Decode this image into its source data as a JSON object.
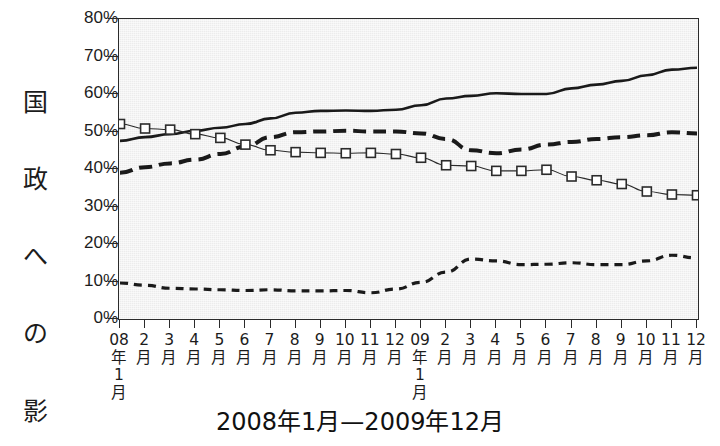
{
  "chart_data": {
    "type": "line",
    "title": "2008年1月—2009年12月",
    "xlabel": "2008年1月—2009年12月",
    "ylabel": "国政への影響力（%）",
    "ylabel_chars": [
      "国",
      "政",
      "へ",
      "の",
      "影",
      "響",
      "力"
    ],
    "ylabel_unit": "（%）",
    "ylim": [
      0,
      80
    ],
    "ytick_step": 10,
    "ytick_labels": [
      "80%",
      "70%",
      "60%",
      "50%",
      "40%",
      "30%",
      "20%",
      "10%",
      "0%"
    ],
    "ytick_values": [
      80,
      70,
      60,
      50,
      40,
      30,
      20,
      10,
      0
    ],
    "grid": false,
    "legend": "none",
    "x": [
      "08年1月",
      "2月",
      "3月",
      "4月",
      "5月",
      "6月",
      "7月",
      "8月",
      "9月",
      "10月",
      "11月",
      "12月",
      "09年1月",
      "2月",
      "3月",
      "4月",
      "5月",
      "6月",
      "7月",
      "8月",
      "9月",
      "10月",
      "11月",
      "12月"
    ],
    "xtick_labels": [
      "08\n年\n1\n月",
      "2\n月",
      "3\n月",
      "4\n月",
      "5\n月",
      "6\n月",
      "7\n月",
      "8\n月",
      "9\n月",
      "10\n月",
      "11\n月",
      "12\n月",
      "09\n年\n1\n月",
      "2\n月",
      "3\n月",
      "4\n月",
      "5\n月",
      "6\n月",
      "7\n月",
      "8\n月",
      "9\n月",
      "10\n月",
      "11\n月",
      "12\n月"
    ],
    "series": [
      {
        "name": "solid-line",
        "style": "solid",
        "marker": "none",
        "color": "#1a1a1a",
        "width": 2.6,
        "values": [
          47.5,
          48.5,
          49.3,
          50.2,
          51.0,
          52.0,
          53.5,
          55.0,
          55.5,
          55.6,
          55.5,
          55.8,
          57.0,
          58.8,
          59.5,
          60.2,
          60.0,
          60.0,
          61.5,
          62.5,
          63.5,
          65.0,
          66.5,
          67.0
        ]
      },
      {
        "name": "long-dashed-line",
        "style": "long-dash",
        "marker": "none",
        "color": "#1a1a1a",
        "width": 4.0,
        "values": [
          39.0,
          40.5,
          41.5,
          42.5,
          44.0,
          46.0,
          48.5,
          49.8,
          50.0,
          50.2,
          50.0,
          50.0,
          49.5,
          48.0,
          45.0,
          44.2,
          45.2,
          46.5,
          47.2,
          48.0,
          48.5,
          49.0,
          49.8,
          49.5
        ]
      },
      {
        "name": "open-square-line",
        "style": "solid-thin",
        "marker": "open-square",
        "color": "#2b2b2b",
        "width": 1.1,
        "values": [
          52.0,
          50.8,
          50.5,
          49.3,
          48.3,
          46.5,
          45.0,
          44.5,
          44.3,
          44.2,
          44.3,
          44.0,
          43.0,
          41.0,
          40.8,
          39.5,
          39.5,
          39.8,
          38.0,
          37.0,
          36.0,
          34.0,
          33.2,
          33.0
        ]
      },
      {
        "name": "short-dashed-line",
        "style": "short-dash",
        "marker": "none",
        "color": "#1a1a1a",
        "width": 3.2,
        "values": [
          9.6,
          9.0,
          8.2,
          8.0,
          7.8,
          7.6,
          7.8,
          7.5,
          7.5,
          7.6,
          7.0,
          8.0,
          9.8,
          12.5,
          16.0,
          15.5,
          14.5,
          14.6,
          15.0,
          14.5,
          14.5,
          15.5,
          17.0,
          16.3
        ]
      }
    ]
  }
}
